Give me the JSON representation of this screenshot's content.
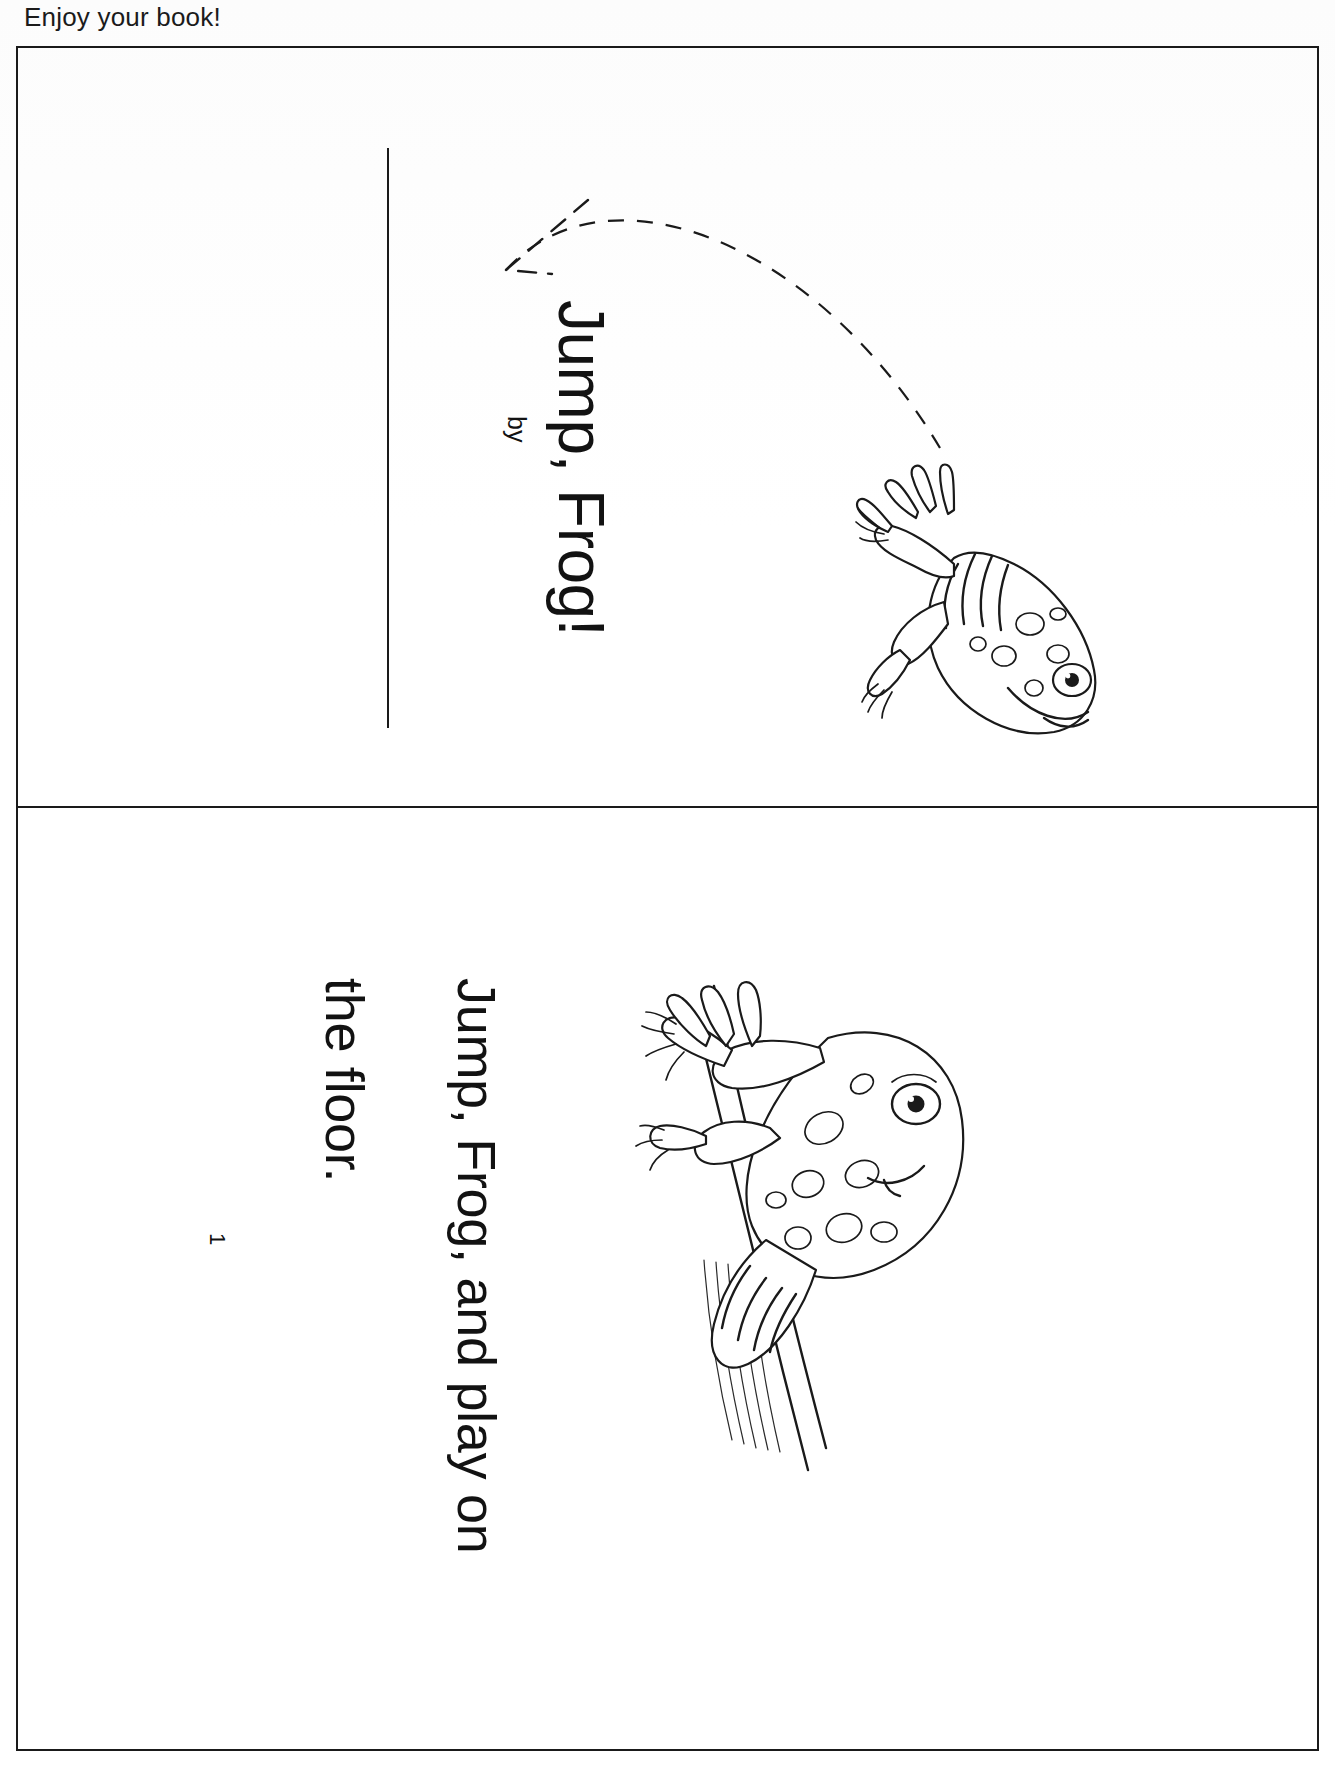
{
  "document": {
    "header_note": "Enjoy your book!",
    "kind": "printable-booklet-page",
    "orientation_note": "page content rotated 90 degrees clockwise"
  },
  "pages": [
    {
      "id": "cover",
      "title": "Jump, Frog!",
      "byline": "by",
      "author_blank": "",
      "illustration": "frog-leaping-with-dashed-jump-arc",
      "rule": "author-signature-rule"
    },
    {
      "id": "page-1",
      "number": "1",
      "lines": [
        "Jump, Frog, and play on",
        "the floor."
      ],
      "illustration": "frog-climbing-stalk"
    }
  ],
  "colors": {
    "ink": "#1a1a1a",
    "paper": "#ffffff",
    "frame": "#1a1a1a"
  }
}
